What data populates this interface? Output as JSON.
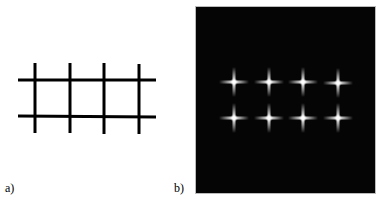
{
  "figure": {
    "panels": [
      {
        "id": "a",
        "label": "a)",
        "description": "Black line grid on white background: 4 vertical lines crossing 2 horizontal lines",
        "vertical_lines_x": [
          35,
          70,
          104,
          139
        ],
        "vertical_span_y": [
          63,
          134
        ],
        "horizontal_lines_y": [
          80,
          116
        ],
        "horizontal_span_x": [
          18,
          156
        ],
        "line_color": "#000000"
      },
      {
        "id": "b",
        "label": "b)",
        "description": "Dark background with 8 glowing white cross-shaped points (2 rows × 4 columns)",
        "background_color": "#050505",
        "points_x": [
          234,
          269,
          303,
          338
        ],
        "points_y": [
          82,
          118
        ],
        "glow_color": "#ffffff"
      }
    ]
  }
}
